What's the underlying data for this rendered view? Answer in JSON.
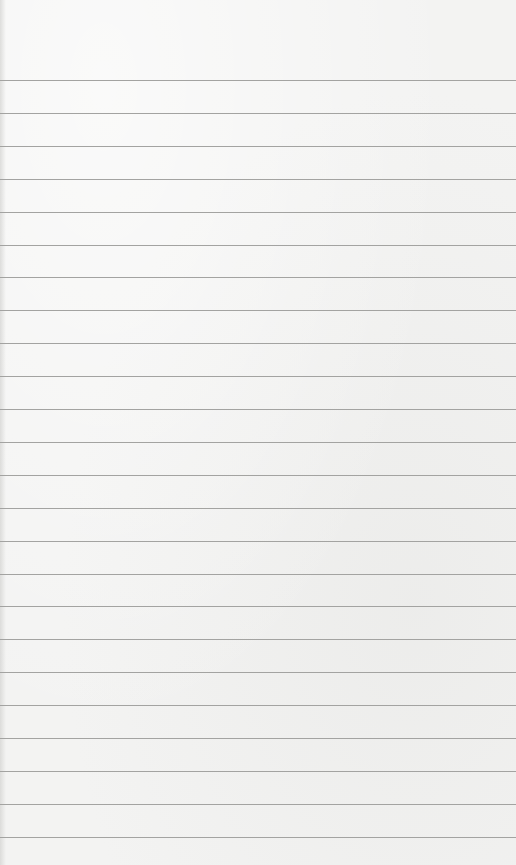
{
  "paper": {
    "type": "lined-notepad",
    "background_color": "#f3f3f2",
    "rule_color": "#a3a3a1",
    "first_rule_y": 80,
    "rule_spacing": 32.9,
    "rule_count": 24
  }
}
